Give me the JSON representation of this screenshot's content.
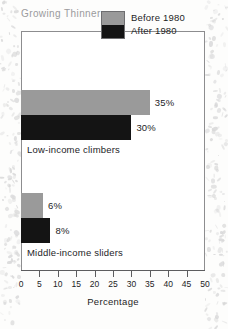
{
  "chart_data": {
    "type": "bar",
    "orientation": "horizontal",
    "title": "Growing Thinner",
    "xlabel": "Percentage",
    "ylabel": "",
    "xlim": [
      0,
      50
    ],
    "xticks": [
      0,
      5,
      10,
      15,
      20,
      25,
      30,
      35,
      40,
      45,
      50
    ],
    "xtick_labels": [
      "0",
      "5",
      "10",
      "15",
      "20",
      "25",
      "30",
      "35",
      "40",
      "45",
      "50"
    ],
    "grid": false,
    "legend_position": "top-right",
    "categories": [
      "Low-income climbers",
      "Middle-income sliders"
    ],
    "series": [
      {
        "name": "Before 1980",
        "color": "#9a9a9a",
        "values": [
          35,
          6
        ],
        "value_labels": [
          "35%",
          "6%"
        ]
      },
      {
        "name": "After 1980",
        "color": "#141414",
        "values": [
          30,
          8
        ],
        "value_labels": [
          "30%",
          "8%"
        ]
      }
    ]
  },
  "colors": {
    "before_1980": "#9a9a9a",
    "after_1980": "#141414",
    "frame": "#8d8d8f",
    "title_text": "#9b9b9d",
    "body_text": "#1d1d1f"
  },
  "legend": {
    "items": [
      {
        "label": "Before 1980",
        "color": "#9a9a9a"
      },
      {
        "label": "After 1980",
        "color": "#141414"
      }
    ]
  },
  "groups": [
    {
      "label": "Low-income climbers",
      "bars": [
        {
          "series": "Before 1980",
          "value": 35,
          "value_label": "35%"
        },
        {
          "series": "After 1980",
          "value": 30,
          "value_label": "30%"
        }
      ]
    },
    {
      "label": "Middle-income sliders",
      "bars": [
        {
          "series": "Before 1980",
          "value": 6,
          "value_label": "6%"
        },
        {
          "series": "After 1980",
          "value": 8,
          "value_label": "8%"
        }
      ]
    }
  ]
}
